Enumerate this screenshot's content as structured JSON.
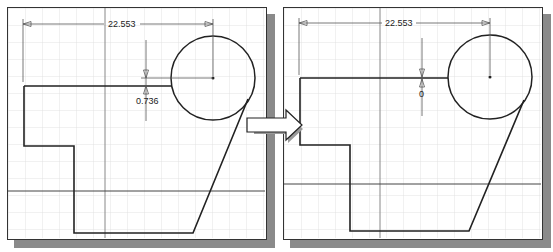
{
  "diagram": {
    "colors": {
      "grid": "#d8d8d8",
      "grid_major": "#bdbdbd",
      "geometry": "#222222",
      "dimension": "#555555",
      "shadow": "#8a8a8a",
      "background": "#ffffff"
    },
    "panels": [
      {
        "name": "before",
        "horizontal_dimension": "22.553",
        "vertical_dimension": "0.736"
      },
      {
        "name": "after",
        "horizontal_dimension": "22.553",
        "vertical_dimension": "0"
      }
    ],
    "transition_arrow": "right-arrow"
  }
}
